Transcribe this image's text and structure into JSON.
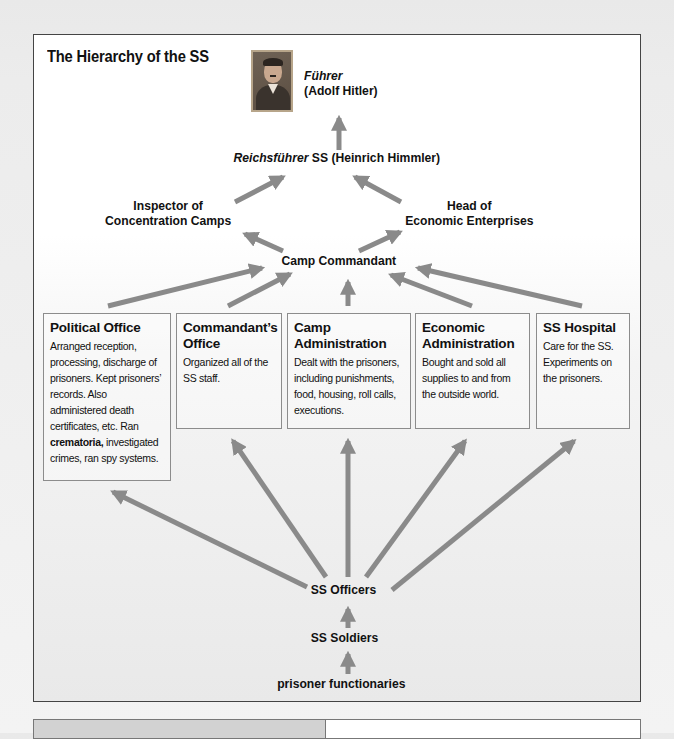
{
  "title": "The Hierarchy of the SS",
  "colors": {
    "arrow": "#8a8a8a",
    "box_border": "#8c8c8c",
    "frame_border": "#444444"
  },
  "nodes": {
    "fuhrer_title": "Führer",
    "fuhrer_name": "(Adolf Hitler)",
    "reichsfuhrer_title": "Reichsführer",
    "reichsfuhrer_rest": " SS (Heinrich Himmler)",
    "inspector_line1": "Inspector of",
    "inspector_line2": "Concentration Camps",
    "head_line1": "Head of",
    "head_line2": "Economic Enterprises",
    "commandant": "Camp Commandant",
    "officers": "SS Officers",
    "soldiers": "SS Soldiers",
    "prisoners": "prisoner functionaries"
  },
  "boxes": [
    {
      "title": "Political Office",
      "text_before": "Arranged reception, processing, discharge of prisoners. Kept prisoners’ records. Also administered death certificates, etc. Ran ",
      "bold": "crematoria,",
      "text_after": " investigated crimes, ran spy systems."
    },
    {
      "title": "Commandant’s Office",
      "text_before": "Organized all of the SS staff.",
      "bold": "",
      "text_after": ""
    },
    {
      "title": "Camp Administration",
      "text_before": "Dealt with the prisoners, including punishments, food, housing, roll calls, executions.",
      "bold": "",
      "text_after": ""
    },
    {
      "title": "Economic Administration",
      "text_before": "Bought and sold all supplies to and from the outside world.",
      "bold": "",
      "text_after": ""
    },
    {
      "title": "SS Hospital",
      "text_before": "Care for the SS. Experiments on the prisoners.",
      "bold": "",
      "text_after": ""
    }
  ],
  "icons": {
    "portrait": "portrait-image"
  }
}
